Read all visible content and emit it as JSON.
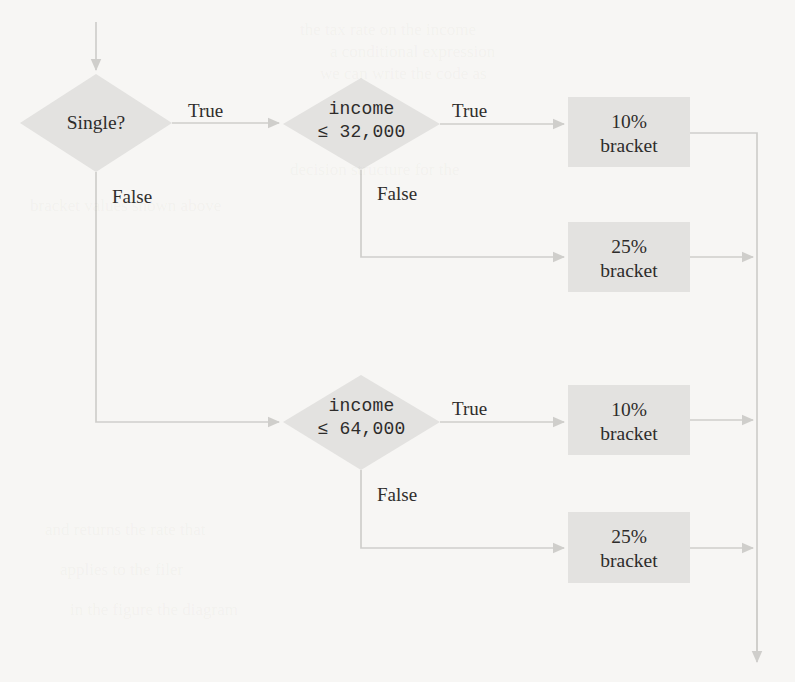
{
  "page": {
    "background_color": "#f7f6f4",
    "ink_color": "#2e2c2b",
    "shape_fill": "#e3e2e0",
    "line_color": "#cfcecb"
  },
  "diagram": {
    "type": "flowchart",
    "entry_arrow": "incoming-arrow-top",
    "exit_arrow": "outgoing-arrow-bottom"
  },
  "decisions": [
    {
      "id": "single",
      "shape": "diamond",
      "text": "Single?",
      "font": "serif",
      "true_label": "True",
      "false_label": "False"
    },
    {
      "id": "income-32000",
      "shape": "diamond",
      "line1": "income",
      "line2": "≤ 32,000",
      "font": "mono",
      "true_label": "True",
      "false_label": "False"
    },
    {
      "id": "income-64000",
      "shape": "diamond",
      "line1": "income",
      "line2": "≤ 64,000",
      "font": "mono",
      "true_label": "True",
      "false_label": "False"
    }
  ],
  "outcomes": [
    {
      "id": "bracket-10-single",
      "line1": "10%",
      "line2": "bracket"
    },
    {
      "id": "bracket-25-single",
      "line1": "25%",
      "line2": "bracket"
    },
    {
      "id": "bracket-10-married",
      "line1": "10%",
      "line2": "bracket"
    },
    {
      "id": "bracket-25-married",
      "line1": "25%",
      "line2": "bracket"
    }
  ],
  "edge_labels": {
    "single_true": "True",
    "single_false": "False",
    "income32_true": "True",
    "income32_false": "False",
    "income64_true": "True",
    "income64_false": "False"
  },
  "ghost_text": {
    "line_a": "the tax rate on the income",
    "line_b": "a conditional expression",
    "line_c": "we can write the code as",
    "line_d": "decision structure for the",
    "line_e": "bracket values shown above",
    "line_f": "and returns the rate that",
    "line_g": "applies to the filer",
    "line_h": "in the figure the diagram"
  }
}
